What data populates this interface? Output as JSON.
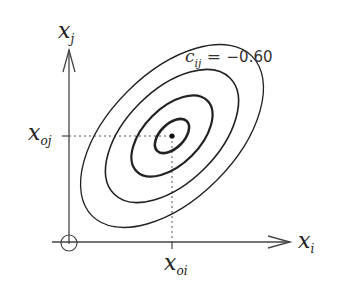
{
  "diagram": {
    "axes": {
      "x_label": "x",
      "x_sub": "i",
      "y_label": "x",
      "y_sub": "j"
    },
    "center": {
      "x_label": "x",
      "x_sub": "oi",
      "y_label": "x",
      "y_sub": "oj"
    },
    "correlation": {
      "symbol": "c",
      "sub": "ij",
      "equals": " = ",
      "value": "−0.60"
    },
    "contours": 5,
    "colors": {
      "stroke": "#222222",
      "guide": "#555555"
    }
  }
}
